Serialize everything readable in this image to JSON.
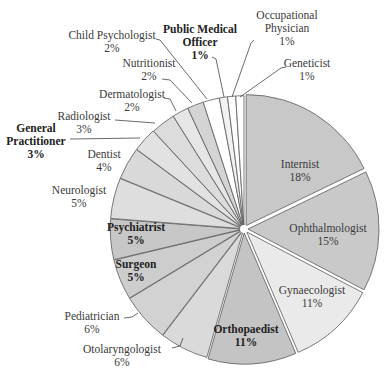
{
  "chart_data": {
    "type": "pie",
    "title": "",
    "start_angle_deg": 0,
    "direction": "clockwise",
    "exploded": true,
    "categories": [
      "Internist",
      "Ophthalmologist",
      "Gynaecologist",
      "Orthopaedist",
      "Otolaryngologist",
      "Pediatrician",
      "Surgeon",
      "Psychiatrist",
      "Neurologist",
      "Dentist",
      "General Practitioner",
      "Radiologist",
      "Dermatologist",
      "Nutritionist",
      "Child Psychologist",
      "Public Medical Officer",
      "Occupational Physician",
      "Geneticist"
    ],
    "values": [
      18,
      15,
      11,
      11,
      6,
      6,
      5,
      5,
      5,
      4,
      3,
      3,
      2,
      2,
      2,
      1,
      1,
      1
    ],
    "unit": "%"
  },
  "slices": [
    {
      "name": "Internist",
      "pct": "18%",
      "value": 18,
      "color": "#c8c8c8",
      "gap": 4,
      "inside": true,
      "label": [
        "Internist",
        "18%"
      ],
      "lx": 300,
      "ly": 168,
      "bold": false
    },
    {
      "name": "Ophthalmologist",
      "pct": "15%",
      "value": 15,
      "color": "#c9c9c9",
      "gap": 4,
      "inside": true,
      "label": [
        "Ophthalmologist",
        "15%"
      ],
      "lx": 328,
      "ly": 232,
      "bold": false
    },
    {
      "name": "Gynaecologist",
      "pct": "11%",
      "value": 11,
      "color": "#eaeaea",
      "gap": 4,
      "inside": true,
      "label": [
        "Gynaecologist",
        "11%"
      ],
      "lx": 312,
      "ly": 294,
      "bold": false
    },
    {
      "name": "Orthopaedist",
      "pct": "11%",
      "value": 11,
      "color": "#c4c4c4",
      "gap": 4,
      "inside": true,
      "label": [
        "Orthopaedist",
        "11%"
      ],
      "lx": 246,
      "ly": 333,
      "bold": true
    },
    {
      "name": "Otolaryngologist",
      "pct": "6%",
      "value": 6,
      "color": "#dadada",
      "gap": 1.5,
      "inside": false,
      "label": [
        "Otolaryngologist",
        "6%"
      ],
      "lx": 122,
      "ly": 353,
      "bold": false,
      "anchor": "middle",
      "leader": "M172,348 L180,346 L183,338"
    },
    {
      "name": "Pediatrician",
      "pct": "6%",
      "value": 6,
      "color": "#d2d2d2",
      "gap": 1.5,
      "inside": false,
      "label": [
        "Pediatrician",
        "6%"
      ],
      "lx": 92,
      "ly": 320,
      "bold": false,
      "anchor": "middle",
      "leader": "M124,318 L132,317 L138,313"
    },
    {
      "name": "Surgeon",
      "pct": "5%",
      "value": 5,
      "color": "#cdcdcd",
      "gap": 1.5,
      "inside": true,
      "label": [
        "Surgeon",
        "5%"
      ],
      "lx": 136,
      "ly": 268,
      "bold": true
    },
    {
      "name": "Psychiatrist",
      "pct": "5%",
      "value": 5,
      "color": "#c7c7c7",
      "gap": 1.5,
      "inside": true,
      "label": [
        "Psychiatrist",
        "5%"
      ],
      "lx": 136,
      "ly": 231,
      "bold": true
    },
    {
      "name": "Neurologist",
      "pct": "5%",
      "value": 5,
      "color": "#dedede",
      "gap": 1.5,
      "inside": false,
      "label": [
        "Neurologist",
        "5%"
      ],
      "lx": 79,
      "ly": 194,
      "bold": false,
      "anchor": "middle"
    },
    {
      "name": "Dentist",
      "pct": "4%",
      "value": 4,
      "color": "#d9d9d9",
      "gap": 1.5,
      "inside": false,
      "label": [
        "Dentist",
        "4%"
      ],
      "lx": 104,
      "ly": 158,
      "bold": false,
      "anchor": "middle"
    },
    {
      "name": "General Practitioner",
      "pct": "3%",
      "value": 3,
      "color": "#e2e2e2",
      "gap": 1.5,
      "inside": false,
      "label": [
        "General",
        "Practitioner",
        "3%"
      ],
      "lx": 36,
      "ly": 132,
      "bold": true,
      "anchor": "middle",
      "leader": "M70,139 L140,138"
    },
    {
      "name": "Radiologist",
      "pct": "3%",
      "value": 3,
      "color": "#dcdcdc",
      "gap": 0.5,
      "inside": false,
      "label": [
        "Radiologist",
        "3%"
      ],
      "lx": 84,
      "ly": 120,
      "bold": false,
      "anchor": "middle",
      "leader": "M115,120 L155,123"
    },
    {
      "name": "Dermatologist",
      "pct": "2%",
      "value": 2,
      "color": "#e6e6e6",
      "gap": 0.5,
      "inside": false,
      "label": [
        "Dermatologist",
        "2%"
      ],
      "lx": 132,
      "ly": 98,
      "bold": false,
      "anchor": "middle",
      "leader": "M164,98 L170,99 L176,111"
    },
    {
      "name": "Nutritionist",
      "pct": "2%",
      "value": 2,
      "color": "#d4d4d4",
      "gap": 0.5,
      "inside": false,
      "label": [
        "Nutritionist",
        "2%"
      ],
      "lx": 149,
      "ly": 67,
      "bold": false,
      "anchor": "middle",
      "leader": "M162,79 L170,80 L192,103"
    },
    {
      "name": "Child Psychologist",
      "pct": "2%",
      "value": 2,
      "color": "#ffffff",
      "gap": 0.5,
      "inside": false,
      "label": [
        "Child Psychologist",
        "2%"
      ],
      "lx": 112,
      "ly": 39,
      "bold": false,
      "anchor": "middle",
      "leader": "M156,39 L160,40 L207,99"
    },
    {
      "name": "Public Medical Officer",
      "pct": "1%",
      "value": 1,
      "color": "#f2f2f2",
      "gap": 0.5,
      "inside": false,
      "label": [
        "Public Medical",
        "Officer",
        "1%"
      ],
      "lx": 200,
      "ly": 33,
      "bold": true,
      "anchor": "middle",
      "leader": "M212,57 L216,59 L224,97"
    },
    {
      "name": "Occupational Physician",
      "pct": "1%",
      "value": 1,
      "color": "#ffffff",
      "gap": 0.5,
      "inside": false,
      "label": [
        "Occupational",
        "Physician",
        "1%"
      ],
      "lx": 287,
      "ly": 19,
      "bold": false,
      "anchor": "middle",
      "leader": "M254,40 L251,43 L232,97"
    },
    {
      "name": "Geneticist",
      "pct": "1%",
      "value": 1,
      "color": "#ffffff",
      "gap": 0.5,
      "inside": false,
      "label": [
        "Geneticist",
        "1%"
      ],
      "lx": 307,
      "ly": 67,
      "bold": false,
      "anchor": "middle",
      "leader": "M286,67 L281,68 L240,97"
    }
  ],
  "geometry": {
    "cx": 244,
    "cy": 229,
    "r": 133
  }
}
